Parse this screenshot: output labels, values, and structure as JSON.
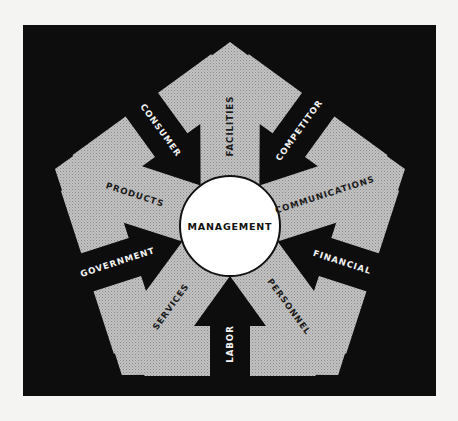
{
  "diagram": {
    "center_label": "MANAGEMENT",
    "outflows": [
      {
        "label": "FACILITIES",
        "angle": -90
      },
      {
        "label": "COMMUNICATIONS",
        "angle": -18
      },
      {
        "label": "PERSONNEL",
        "angle": 54
      },
      {
        "label": "SERVICES",
        "angle": 126
      },
      {
        "label": "PRODUCTS",
        "angle": 198
      }
    ],
    "inflows": [
      {
        "label": "COMPETITOR",
        "angle": -54
      },
      {
        "label": "FINANCIAL",
        "angle": 18
      },
      {
        "label": "LABOR",
        "angle": 90
      },
      {
        "label": "GOVERNMENT",
        "angle": 162
      },
      {
        "label": "CONSUMER",
        "angle": 234
      }
    ],
    "colors": {
      "background": "#0d0d0d",
      "outflow_fill": "#b9b9b9",
      "inflow_fill": "#0d0d0d",
      "center_fill": "#ffffff",
      "page": "#f4f4f2"
    }
  }
}
